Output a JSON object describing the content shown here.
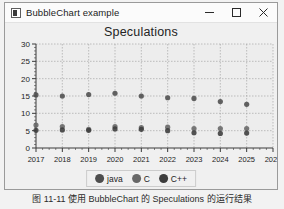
{
  "window": {
    "title": "BubbleChart example",
    "icon": "app-icon",
    "controls": {
      "minimize": "minimize-icon",
      "maximize": "maximize-icon",
      "close": "close-icon"
    }
  },
  "caption": {
    "text": "图 11-11   使用 BubbleChart 的 Speculations 的运行结果"
  },
  "colors": {
    "java": "#4d4d4d",
    "c": "#676767",
    "cpp": "#3c3c3c",
    "plot_background": "#ededed",
    "grid": "#9c9c9c",
    "axis": "#3a3a3a"
  },
  "chart_data": {
    "type": "scatter",
    "title": "Speculations",
    "xlabel": "",
    "ylabel": "",
    "xlim": [
      2017,
      2026
    ],
    "ylim": [
      0,
      30
    ],
    "xticks": [
      2017,
      2018,
      2019,
      2020,
      2021,
      2022,
      2023,
      2024,
      2025,
      2026
    ],
    "yticks": [
      0,
      5,
      10,
      15,
      20,
      25,
      30
    ],
    "grid": true,
    "legend_position": "bottom",
    "series": [
      {
        "name": "java",
        "color": "#4d4d4d",
        "x": [
          2017,
          2018,
          2019,
          2020,
          2021,
          2022,
          2023,
          2024,
          2025
        ],
        "values": [
          15.3,
          15.0,
          15.4,
          15.8,
          15.0,
          14.5,
          14.3,
          13.4,
          12.6
        ]
      },
      {
        "name": "C",
        "color": "#676767",
        "x": [
          2017,
          2018,
          2019,
          2020,
          2021,
          2022,
          2023,
          2024,
          2025
        ],
        "values": [
          6.6,
          6.2,
          5.4,
          6.2,
          5.9,
          6.0,
          5.6,
          5.6,
          5.6
        ]
      },
      {
        "name": "C++",
        "color": "#3c3c3c",
        "x": [
          2017,
          2018,
          2019,
          2020,
          2021,
          2022,
          2023,
          2024,
          2025
        ],
        "values": [
          5.1,
          5.2,
          5.1,
          5.5,
          5.4,
          5.0,
          4.4,
          4.2,
          4.3
        ]
      }
    ]
  }
}
